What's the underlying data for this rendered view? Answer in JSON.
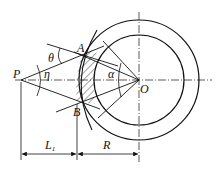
{
  "figure": {
    "type": "geometry-diagram",
    "colors": {
      "stroke": "#111111",
      "background": "#ffffff"
    }
  },
  "points": {
    "P": {
      "label": "P"
    },
    "A": {
      "label": "A"
    },
    "B": {
      "label": "B"
    },
    "O": {
      "label": "O"
    }
  },
  "angles": {
    "theta": {
      "label": "θ"
    },
    "eta": {
      "label": "η"
    },
    "alpha": {
      "label": "α"
    }
  },
  "dimensions": {
    "L1": {
      "label": "L",
      "subscript": "1"
    },
    "R": {
      "label": "R"
    }
  }
}
